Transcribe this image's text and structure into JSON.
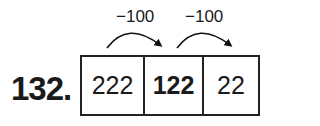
{
  "problem_number": "132.",
  "cells": [
    {
      "value": "222",
      "bold": false
    },
    {
      "value": "122",
      "bold": true
    },
    {
      "value": "22",
      "bold": false
    }
  ],
  "operations": [
    {
      "label": "−100",
      "from": 0,
      "to": 1
    },
    {
      "label": "−100",
      "from": 1,
      "to": 2
    }
  ]
}
